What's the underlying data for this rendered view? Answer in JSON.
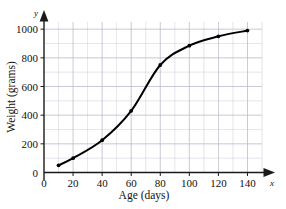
{
  "chart_data": {
    "type": "line",
    "title": "",
    "xlabel": "Age (days)",
    "ylabel": "Weight (grams)",
    "x_axis_variable": "x",
    "y_axis_variable": "y",
    "xlim": [
      0,
      150
    ],
    "ylim": [
      0,
      1050
    ],
    "xticks": [
      0,
      20,
      40,
      60,
      80,
      100,
      120,
      140
    ],
    "yticks": [
      0,
      200,
      400,
      600,
      800,
      1000
    ],
    "xtick_labels": [
      "0",
      "20",
      "40",
      "60",
      "80",
      "100",
      "120",
      "140"
    ],
    "ytick_labels": [
      "0",
      "200",
      "400",
      "600",
      "800",
      "1000"
    ],
    "grid": true,
    "grid_minor_x_step": 10,
    "grid_minor_y_step": 100,
    "legend": false,
    "legend_position": "none",
    "marker": "filled-circle",
    "line_color": "#000000",
    "grid_color": "#b9b9c9",
    "axis_color": "#1a1a1a",
    "x": [
      10,
      20,
      40,
      60,
      80,
      100,
      120,
      140
    ],
    "values": [
      50,
      100,
      225,
      430,
      750,
      885,
      950,
      990
    ],
    "series": [
      {
        "name": "Weight",
        "x": [
          10,
          20,
          40,
          60,
          80,
          100,
          120,
          140
        ],
        "values": [
          50,
          100,
          225,
          430,
          750,
          885,
          950,
          990
        ]
      }
    ],
    "annotations": []
  },
  "axes": {
    "x_arrow": "arrow-right",
    "y_arrow": "arrow-up"
  }
}
